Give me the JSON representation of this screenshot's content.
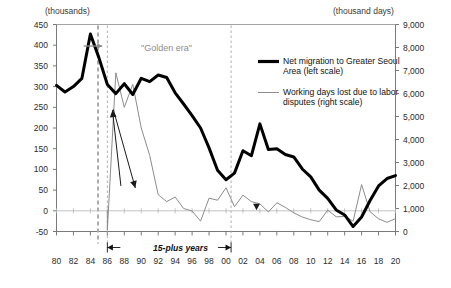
{
  "axis_titles": {
    "left_unit": "(thousands)",
    "right_unit": "(thousand days)"
  },
  "legend": {
    "items": [
      {
        "label": "Net migration to Greater Seoul\nArea (left scale)",
        "color": "#000000",
        "style": "thick-black-line",
        "swatch_name": "legend-swatch-net-migration"
      },
      {
        "label": "Working days lost due to labor\ndisputes (right scale)",
        "color": "#8c8c8c",
        "style": "thin-gray-line",
        "swatch_name": "legend-swatch-working-days"
      }
    ]
  },
  "annotations": {
    "golden_era": "\"Golden era\"",
    "fifteen_plus_years": "15-plus years"
  },
  "chart_data": {
    "type": "line",
    "title": "",
    "xlabel": "",
    "ylabel": "thousands",
    "y2label": "thousand days",
    "xlim": [
      1980,
      2020
    ],
    "ylim": [
      -50,
      450
    ],
    "y2lim": [
      0,
      9000
    ],
    "yticks": [
      450,
      400,
      350,
      300,
      250,
      200,
      150,
      100,
      50,
      0,
      -50
    ],
    "ytick_labels": [
      "450",
      "400",
      "350",
      "300",
      "250",
      "200",
      "150",
      "100",
      "50",
      "0",
      "-50"
    ],
    "y2ticks": [
      9000,
      8000,
      7000,
      6000,
      5000,
      4000,
      3000,
      2000,
      1000,
      0
    ],
    "y2tick_labels": [
      "9,000",
      "8,000",
      "7,000",
      "6,000",
      "5,000",
      "4,000",
      "3,000",
      "2,000",
      "1,000",
      "0"
    ],
    "xticks": [
      1980,
      1982,
      1984,
      1986,
      1988,
      1990,
      1992,
      1994,
      1996,
      1998,
      2000,
      2002,
      2004,
      2006,
      2008,
      2010,
      2012,
      2014,
      2016,
      2018,
      2020
    ],
    "xtick_labels": [
      "80",
      "82",
      "84",
      "86",
      "88",
      "90",
      "92",
      "94",
      "96",
      "98",
      "00",
      "02",
      "04",
      "06",
      "08",
      "10",
      "12",
      "14",
      "16",
      "18",
      "20"
    ],
    "grid": false,
    "legend_position": "upper-right-inside",
    "series": [
      {
        "name": "Net migration to Greater Seoul Area (left scale)",
        "axis": "left",
        "units": "thousands",
        "color": "#000000",
        "line_width": 3.0,
        "x": [
          1980,
          1981,
          1982,
          1983,
          1984,
          1985,
          1986,
          1987,
          1988,
          1989,
          1990,
          1991,
          1992,
          1993,
          1994,
          1995,
          1996,
          1997,
          1998,
          1999,
          2000,
          2001,
          2002,
          2003,
          2004,
          2005,
          2006,
          2007,
          2008,
          2009,
          2010,
          2011,
          2012,
          2013,
          2014,
          2015,
          2016,
          2017,
          2018,
          2019,
          2020
        ],
        "values": [
          303,
          287,
          300,
          320,
          427,
          370,
          305,
          283,
          307,
          281,
          320,
          312,
          328,
          322,
          285,
          258,
          230,
          200,
          152,
          98,
          75,
          91,
          145,
          133,
          210,
          148,
          150,
          136,
          130,
          101,
          82,
          50,
          30,
          2,
          -10,
          -38,
          -15,
          25,
          60,
          78,
          85
        ]
      },
      {
        "name": "Working days lost due to labor disputes (right scale)",
        "axis": "right",
        "units": "thousand days",
        "color": "#8c8c8c",
        "line_width": 1.0,
        "x": [
          1986,
          1987,
          1988,
          1989,
          1990,
          1991,
          1992,
          1993,
          1994,
          1995,
          1996,
          1997,
          1998,
          1999,
          2000,
          2001,
          2002,
          2003,
          2004,
          2005,
          2006,
          2007,
          2008,
          2009,
          2010,
          2011,
          2012,
          2013,
          2014,
          2015,
          2016,
          2017,
          2018,
          2019,
          2020
        ],
        "values": [
          70,
          6900,
          5400,
          6400,
          4500,
          3300,
          1600,
          1300,
          1500,
          1000,
          890,
          450,
          1450,
          1360,
          1900,
          1080,
          1580,
          1300,
          1200,
          850,
          1250,
          1050,
          810,
          630,
          510,
          430,
          930,
          640,
          650,
          450,
          2040,
          860,
          550,
          400,
          560
        ]
      }
    ],
    "annotation_arrows": [
      {
        "name": "golden-era-arrow",
        "from": [
          1983.2,
          398
        ],
        "to": [
          1985.4,
          398
        ],
        "color": "#8d8d8d"
      },
      {
        "name": "migration-pointer-arrow",
        "from": [
          1987.6,
          60
        ],
        "to": [
          1986.6,
          243
        ],
        "color": "#1a1a1a"
      },
      {
        "name": "strike-pointer-arrow",
        "from": [
          1986.7,
          245
        ],
        "to": [
          1989.3,
          55
        ],
        "color": "#1a1a1a"
      },
      {
        "name": "tick-marker-down",
        "from": [
          2003.6,
          0
        ],
        "to": [
          2003.6,
          0
        ],
        "color": "#1a1a1a"
      }
    ],
    "vertical_dashed_lines": [
      {
        "name": "dashed-line-1985",
        "x": 1984.9,
        "color": "#a8a8a8"
      },
      {
        "name": "dashed-line-1986",
        "x": 1986.0,
        "color": "#a8a8a8"
      },
      {
        "name": "dashed-line-2001",
        "x": 2000.6,
        "color": "#a8a8a8"
      }
    ],
    "span_annotation": {
      "label": "15-plus years",
      "x_from": 1986.0,
      "x_to": 2000.6
    }
  }
}
